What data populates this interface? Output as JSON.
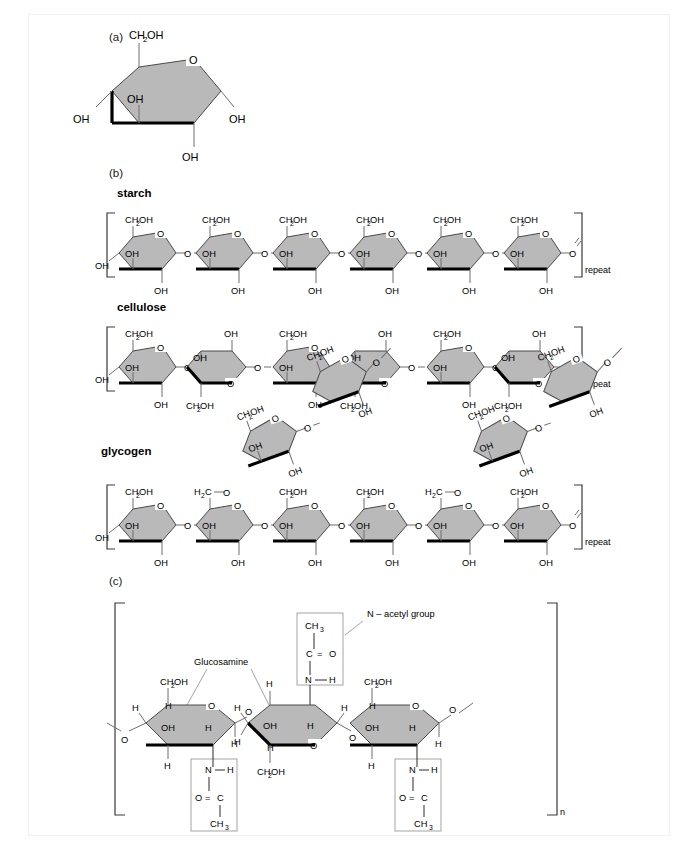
{
  "figure": {
    "panels": [
      {
        "id": "a",
        "label": "(a)"
      },
      {
        "id": "b",
        "label": "(b)"
      },
      {
        "id": "c",
        "label": "(c)"
      }
    ]
  },
  "labels": {
    "ch2oh": "CH",
    "ch2oh_sub": "2",
    "ch2oh_tail": "OH",
    "oh": "OH",
    "o": "O",
    "h": "H",
    "h2c": "H",
    "h2c_sub": "2",
    "h2c_tail": "C",
    "ch3": "CH",
    "ch3_sub": "3",
    "c": "C",
    "n": "N",
    "repeat": "repeat",
    "n_subscript": "n",
    "eq": "=",
    "dash": "—"
  },
  "panel_a": {
    "title": "(a)",
    "substituents": {
      "top": "CH2OH",
      "ring_oxygen": "O",
      "left": "OH",
      "inner": "OH",
      "right": "OH",
      "bottom": "OH"
    }
  },
  "panel_b": {
    "polymers": [
      {
        "name": "starch",
        "bracket_label": "repeat",
        "linkage": "alpha-1,4",
        "units": 6,
        "orientation": "all-same",
        "unit_labels": {
          "top": "CH2OH",
          "ring_o": "O",
          "inner": "OH",
          "left": "OH",
          "bottom": "OH",
          "link": "O"
        }
      },
      {
        "name": "cellulose",
        "bracket_label": "repeat",
        "linkage": "beta-1,4",
        "units": 6,
        "orientation": "alternating",
        "unit_labels": {
          "top": "CH2OH",
          "ring_o": "O",
          "inner": "OH",
          "left": "OH",
          "bottom": "OH",
          "link": "O"
        },
        "flipped_labels": {
          "top": "OH",
          "ring_o": "O",
          "inner": "OH",
          "bottom": "CH2OH",
          "link": "O"
        }
      },
      {
        "name": "glycogen",
        "bracket_label": "repeat",
        "linkage": "alpha-1,4 with alpha-1,6 branches",
        "units": 6,
        "branches": 2,
        "branch_link_label": "H2C",
        "branch_link_o": "O",
        "unit_labels": {
          "top": "CH2OH",
          "ring_o": "O",
          "inner": "OH",
          "left": "OH",
          "bottom": "OH",
          "link": "O"
        }
      }
    ]
  },
  "panel_c": {
    "title": "(c)",
    "polymer": "chitin",
    "bracket_label": "n",
    "units": 3,
    "annotations": [
      {
        "text": "Glucosamine"
      },
      {
        "text": "N – acetyl group"
      }
    ],
    "acetyl_group_up": {
      "ch3": "CH3",
      "c": "C",
      "eq": "=",
      "o": "O",
      "n": "N",
      "h": "H"
    },
    "acetyl_group_down": {
      "n": "N",
      "h": "H",
      "o": "O",
      "eq": "=",
      "c": "C",
      "ch3": "CH3"
    },
    "unit_labels": {
      "top": "CH2OH",
      "ring_o": "O",
      "oh": "OH",
      "h": "H",
      "link": "O"
    }
  },
  "colors": {
    "ring_fill": "#b9b9b9",
    "ring_stroke": "#4a4a4a",
    "front_edge": "#000000",
    "bond": "#6f6f6f",
    "text": "#000000",
    "background": "#ffffff",
    "frame": "#f0f0f0"
  }
}
